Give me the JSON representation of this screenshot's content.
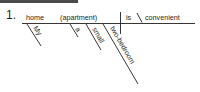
{
  "header": {
    "color": "#4a4a4a"
  },
  "exercise": {
    "number": "1.",
    "subject": "home",
    "appositive": "(apartment)",
    "verb": "is",
    "complement": "convenient",
    "modifiers": [
      {
        "word": "My",
        "modifies": "home"
      },
      {
        "word": "a",
        "modifies": "apartment"
      },
      {
        "word": "small",
        "modifies": "apartment"
      },
      {
        "word": "two-bedroom",
        "modifies": "apartment"
      }
    ]
  }
}
